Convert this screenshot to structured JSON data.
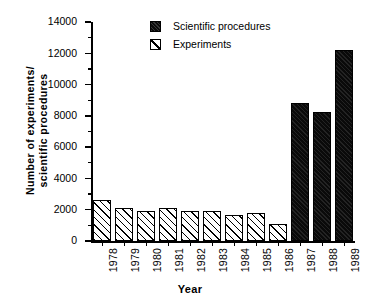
{
  "chart_data": {
    "type": "bar",
    "title": "",
    "xlabel": "Year",
    "ylabel": "Number of experiments/ scientific procedures",
    "ylabel_lines": [
      "Number of experiments/",
      "scientific procedures"
    ],
    "categories": [
      "1978",
      "1979",
      "1980",
      "1981",
      "1982",
      "1983",
      "1984",
      "1985",
      "1986",
      "1987",
      "1988",
      "1989"
    ],
    "ylim": [
      0,
      14000
    ],
    "ytick_labels": [
      "0",
      "2000",
      "4000",
      "6000",
      "8000",
      "10000",
      "12000",
      "14000"
    ],
    "ytick_values": [
      0,
      2000,
      4000,
      6000,
      8000,
      10000,
      12000,
      14000
    ],
    "yminor_values": [
      1000,
      3000,
      5000,
      7000,
      9000,
      11000,
      13000
    ],
    "grid": false,
    "legend_position": "top-center",
    "series": [
      {
        "name": "Scientific procedures",
        "style": "solid-black",
        "values": [
          null,
          null,
          null,
          null,
          null,
          null,
          null,
          null,
          null,
          8800,
          8250,
          12200
        ]
      },
      {
        "name": "Experiments",
        "style": "diagonal-hatch",
        "values": [
          2600,
          2100,
          1950,
          2100,
          1950,
          1900,
          1650,
          1800,
          1100,
          null,
          null,
          null
        ]
      }
    ],
    "bars": [
      {
        "category": "1978",
        "value": 2600,
        "series": "Experiments"
      },
      {
        "category": "1979",
        "value": 2100,
        "series": "Experiments"
      },
      {
        "category": "1980",
        "value": 1950,
        "series": "Experiments"
      },
      {
        "category": "1981",
        "value": 2100,
        "series": "Experiments"
      },
      {
        "category": "1982",
        "value": 1950,
        "series": "Experiments"
      },
      {
        "category": "1983",
        "value": 1900,
        "series": "Experiments"
      },
      {
        "category": "1984",
        "value": 1650,
        "series": "Experiments"
      },
      {
        "category": "1985",
        "value": 1800,
        "series": "Experiments"
      },
      {
        "category": "1986",
        "value": 1100,
        "series": "Experiments"
      },
      {
        "category": "1987",
        "value": 8800,
        "series": "Scientific procedures"
      },
      {
        "category": "1988",
        "value": 8250,
        "series": "Scientific procedures"
      },
      {
        "category": "1989",
        "value": 12200,
        "series": "Scientific procedures"
      }
    ],
    "colors": {
      "axis": "#000000",
      "background": "#ffffff",
      "solid_bar": "#0a0a0a",
      "hatch_bar_face": "#ffffff",
      "hatch_bar_line": "#000000"
    }
  },
  "legend": {
    "items": [
      {
        "label": "Scientific procedures",
        "style": "solid"
      },
      {
        "label": "Experiments",
        "style": "hatch"
      }
    ]
  }
}
